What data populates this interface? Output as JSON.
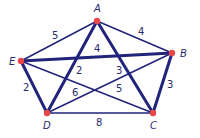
{
  "diagram": {
    "type": "weighted-graph",
    "colors": {
      "edge": "#22237a",
      "node": "#e8474a",
      "label": "#2a2a6e"
    },
    "nodes": [
      {
        "id": "A",
        "label": "A",
        "x": 97,
        "y": 21,
        "lx": 94,
        "ly": 12
      },
      {
        "id": "B",
        "label": "B",
        "x": 172,
        "y": 53,
        "lx": 180,
        "ly": 57
      },
      {
        "id": "C",
        "label": "C",
        "x": 153,
        "y": 113,
        "lx": 150,
        "ly": 129
      },
      {
        "id": "D",
        "label": "D",
        "x": 47,
        "y": 113,
        "lx": 43,
        "ly": 129
      },
      {
        "id": "E",
        "label": "E",
        "x": 21,
        "y": 61,
        "lx": 9,
        "ly": 65
      }
    ],
    "edges": [
      {
        "from": "A",
        "to": "E",
        "weight": "5",
        "thick": false,
        "lx": 52,
        "ly": 39
      },
      {
        "from": "A",
        "to": "B",
        "weight": "4",
        "thick": false,
        "lx": 138,
        "ly": 35
      },
      {
        "from": "E",
        "to": "B",
        "weight": "4",
        "thick": true,
        "lx": 94,
        "ly": 52
      },
      {
        "from": "A",
        "to": "D",
        "weight": "2",
        "thick": true,
        "lx": 76,
        "ly": 74
      },
      {
        "from": "A",
        "to": "C",
        "weight": "3",
        "thick": true,
        "lx": 116,
        "ly": 74
      },
      {
        "from": "E",
        "to": "D",
        "weight": "2",
        "thick": true,
        "lx": 23,
        "ly": 91
      },
      {
        "from": "E",
        "to": "C",
        "weight": "5",
        "thick": false,
        "lx": 116,
        "ly": 92
      },
      {
        "from": "D",
        "to": "B",
        "weight": "6",
        "thick": false,
        "lx": 72,
        "ly": 96
      },
      {
        "from": "B",
        "to": "C",
        "weight": "3",
        "thick": true,
        "lx": 167,
        "ly": 88
      },
      {
        "from": "D",
        "to": "C",
        "weight": "8",
        "thick": false,
        "lx": 96,
        "ly": 126
      }
    ]
  }
}
